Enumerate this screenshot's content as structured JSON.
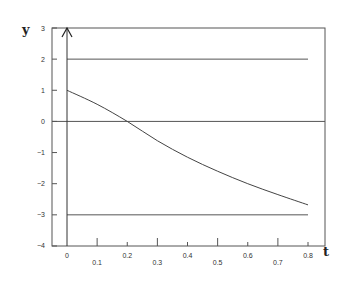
{
  "chart_data": {
    "type": "line",
    "title": "",
    "xlabel": "t",
    "ylabel": "y",
    "xlim": [
      0,
      0.8
    ],
    "ylim": [
      -4,
      3
    ],
    "x_ticks": [
      "0",
      "0.1",
      "0.2",
      "0.3",
      "0.4",
      "0.5",
      "0.6",
      "0.7",
      "0.8"
    ],
    "y_ticks": [
      "3",
      "2",
      "1",
      "0",
      "-1",
      "-2",
      "-3",
      "-4"
    ],
    "grid": false,
    "legend": null,
    "series": [
      {
        "name": "y(t)",
        "x": [
          0,
          0.1,
          0.2,
          0.3,
          0.4,
          0.5,
          0.6,
          0.7,
          0.8
        ],
        "values": [
          1.0,
          0.55,
          0.0,
          -0.62,
          -1.15,
          -1.6,
          -2.0,
          -2.35,
          -2.68
        ]
      }
    ],
    "reference_lines": [
      {
        "y": 2,
        "x_range": [
          0,
          0.8
        ]
      },
      {
        "y": 0,
        "x_range": [
          -0.05,
          0.87
        ]
      },
      {
        "y": -3,
        "x_range": [
          0,
          0.8
        ]
      }
    ],
    "annotations": [
      "vertical arrow at t=0 pointing up (y-axis)"
    ]
  }
}
